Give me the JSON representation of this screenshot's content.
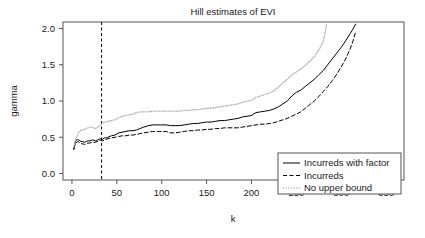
{
  "chart_data": {
    "type": "line",
    "title": "Hill estimates of EVI",
    "xlabel": "k",
    "ylabel": "gamma",
    "xlim": [
      -10,
      370
    ],
    "ylim": [
      -0.09,
      2.09
    ],
    "xticks": [
      0,
      50,
      100,
      150,
      200,
      250,
      300,
      350
    ],
    "xtick_labels": [
      "0",
      "50",
      "100",
      "150",
      "200",
      "250",
      "300",
      "350"
    ],
    "yticks": [
      0.0,
      0.5,
      1.0,
      1.5,
      2.0
    ],
    "ytick_labels": [
      "0.0",
      "0.5",
      "1.0",
      "1.5",
      "2.0"
    ],
    "grid": false,
    "legend_position": "lower right",
    "annotations": [
      {
        "name": "optimal-k-vline",
        "type": "vline",
        "x": 33,
        "style": "dashed",
        "color": "#000000"
      }
    ],
    "series": [
      {
        "name": "Incurreds with factor",
        "style": "solid",
        "color": "#000000",
        "x": [
          2,
          4,
          6,
          8,
          10,
          12,
          14,
          16,
          18,
          20,
          22,
          24,
          26,
          28,
          30,
          32,
          34,
          36,
          38,
          40,
          44,
          48,
          52,
          56,
          60,
          64,
          68,
          72,
          76,
          80,
          85,
          90,
          95,
          100,
          105,
          110,
          115,
          120,
          125,
          130,
          135,
          140,
          145,
          150,
          155,
          160,
          165,
          170,
          175,
          180,
          185,
          190,
          195,
          200,
          205,
          210,
          215,
          220,
          225,
          230,
          235,
          240,
          245,
          250,
          255,
          260,
          265,
          270,
          275,
          280,
          285,
          290,
          295,
          300,
          305,
          310,
          313,
          316
        ],
        "y": [
          0.33,
          0.45,
          0.47,
          0.46,
          0.44,
          0.44,
          0.43,
          0.44,
          0.45,
          0.45,
          0.46,
          0.46,
          0.45,
          0.46,
          0.47,
          0.48,
          0.47,
          0.49,
          0.49,
          0.5,
          0.52,
          0.53,
          0.56,
          0.57,
          0.58,
          0.59,
          0.59,
          0.6,
          0.62,
          0.64,
          0.66,
          0.67,
          0.67,
          0.67,
          0.67,
          0.66,
          0.66,
          0.66,
          0.67,
          0.68,
          0.69,
          0.69,
          0.7,
          0.71,
          0.71,
          0.72,
          0.73,
          0.73,
          0.74,
          0.75,
          0.76,
          0.78,
          0.79,
          0.8,
          0.84,
          0.85,
          0.86,
          0.87,
          0.89,
          0.92,
          0.96,
          1.0,
          1.07,
          1.12,
          1.15,
          1.2,
          1.25,
          1.3,
          1.36,
          1.42,
          1.5,
          1.58,
          1.66,
          1.74,
          1.83,
          1.93,
          1.99,
          2.06
        ]
      },
      {
        "name": "Incurreds",
        "style": "dashed",
        "color": "#000000",
        "x": [
          2,
          4,
          6,
          8,
          10,
          12,
          14,
          16,
          18,
          20,
          22,
          24,
          26,
          28,
          30,
          32,
          34,
          36,
          38,
          40,
          44,
          48,
          52,
          56,
          60,
          64,
          68,
          72,
          76,
          80,
          85,
          90,
          95,
          100,
          105,
          110,
          115,
          120,
          125,
          130,
          135,
          140,
          145,
          150,
          155,
          160,
          165,
          170,
          175,
          180,
          185,
          190,
          195,
          200,
          205,
          210,
          215,
          220,
          225,
          230,
          235,
          240,
          245,
          250,
          255,
          260,
          265,
          270,
          275,
          280,
          285,
          290,
          295,
          300,
          305,
          310,
          313,
          316
        ],
        "y": [
          0.34,
          0.42,
          0.44,
          0.43,
          0.41,
          0.41,
          0.4,
          0.41,
          0.42,
          0.42,
          0.43,
          0.43,
          0.43,
          0.44,
          0.45,
          0.46,
          0.45,
          0.46,
          0.47,
          0.48,
          0.49,
          0.5,
          0.51,
          0.52,
          0.52,
          0.53,
          0.53,
          0.54,
          0.55,
          0.56,
          0.57,
          0.58,
          0.58,
          0.58,
          0.58,
          0.56,
          0.56,
          0.57,
          0.58,
          0.59,
          0.59,
          0.6,
          0.6,
          0.61,
          0.61,
          0.62,
          0.62,
          0.63,
          0.63,
          0.63,
          0.63,
          0.64,
          0.65,
          0.66,
          0.67,
          0.68,
          0.68,
          0.69,
          0.7,
          0.72,
          0.74,
          0.76,
          0.79,
          0.82,
          0.85,
          0.9,
          0.95,
          1.0,
          1.06,
          1.13,
          1.2,
          1.28,
          1.37,
          1.47,
          1.58,
          1.72,
          1.82,
          1.95
        ]
      },
      {
        "name": "No upper bound",
        "style": "dotted",
        "color": "#b4b4b4",
        "x": [
          2,
          4,
          6,
          8,
          10,
          12,
          14,
          16,
          18,
          20,
          22,
          24,
          26,
          28,
          30,
          32,
          34,
          36,
          38,
          40,
          44,
          48,
          52,
          56,
          60,
          64,
          68,
          72,
          76,
          80,
          85,
          90,
          95,
          100,
          105,
          110,
          115,
          120,
          125,
          130,
          135,
          140,
          145,
          150,
          155,
          160,
          165,
          170,
          175,
          180,
          185,
          190,
          195,
          200,
          205,
          210,
          215,
          220,
          225,
          230,
          235,
          240,
          245,
          250,
          255,
          260,
          265,
          270,
          275,
          280,
          284
        ],
        "y": [
          0.36,
          0.48,
          0.52,
          0.57,
          0.6,
          0.6,
          0.61,
          0.62,
          0.63,
          0.64,
          0.64,
          0.63,
          0.62,
          0.63,
          0.65,
          0.67,
          0.69,
          0.71,
          0.71,
          0.72,
          0.73,
          0.74,
          0.77,
          0.79,
          0.8,
          0.81,
          0.82,
          0.84,
          0.85,
          0.85,
          0.85,
          0.86,
          0.86,
          0.86,
          0.86,
          0.86,
          0.86,
          0.86,
          0.87,
          0.87,
          0.88,
          0.88,
          0.89,
          0.9,
          0.9,
          0.91,
          0.92,
          0.93,
          0.94,
          0.95,
          0.96,
          0.98,
          1.0,
          1.01,
          1.05,
          1.07,
          1.09,
          1.11,
          1.14,
          1.19,
          1.25,
          1.3,
          1.36,
          1.4,
          1.44,
          1.49,
          1.55,
          1.61,
          1.7,
          1.82,
          2.07
        ]
      }
    ]
  },
  "legend": {
    "entries": [
      {
        "label": "Incurreds with factor",
        "style": "solid",
        "color": "#000000"
      },
      {
        "label": "Incurreds",
        "style": "dashed",
        "color": "#000000"
      },
      {
        "label": "No upper bound",
        "style": "dotted",
        "color": "#b4b4b4"
      }
    ]
  },
  "colors": {
    "background": "#ffffff",
    "frame": "#555555",
    "text": "#1a1a1a",
    "series_primary": "#000000",
    "series_light": "#b4b4b4"
  }
}
